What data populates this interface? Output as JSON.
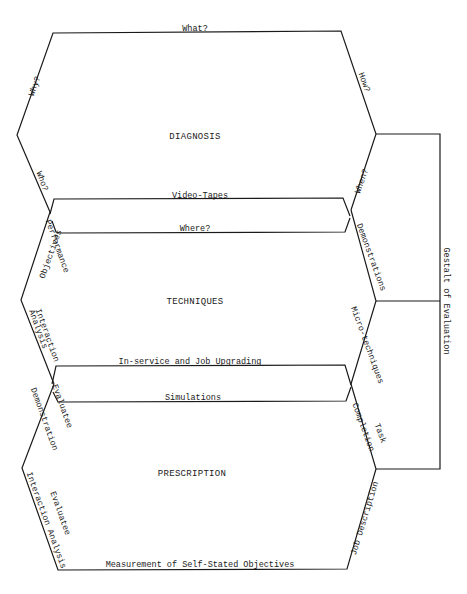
{
  "diagram": {
    "stages": [
      {
        "id": "diagnosis",
        "label": "DIAGNOSIS"
      },
      {
        "id": "techniques",
        "label": "TECHNIQUES"
      },
      {
        "id": "prescription",
        "label": "PRESCRIPTION"
      }
    ],
    "diagnosis_edges": {
      "top": "What?",
      "upper_left": "Why?",
      "upper_right": "How?",
      "lower_left": "Who?",
      "lower_right": "When?"
    },
    "band1": {
      "top": "Video-Tapes",
      "bottom": "Where?"
    },
    "techniques_edges": {
      "upper_left": [
        "Performance",
        "Objectives"
      ],
      "upper_right": "Demonstrations",
      "lower_left": [
        "Interaction",
        "Analysis"
      ],
      "lower_right": "Micro-techniques"
    },
    "band2": {
      "top": "In-service and Job Upgrading",
      "bottom": "Simulations"
    },
    "prescription_edges": {
      "upper_left": [
        "Evaluatee",
        "Demonstration"
      ],
      "upper_right": [
        "Task",
        "Completion"
      ],
      "lower_left": [
        "Evaluatee",
        "Interaction Analysis"
      ],
      "lower_right": "Job Description",
      "bottom": "Measurement of Self-Stated Objectives"
    },
    "bracket": {
      "label": "Gestalt of Evaluation"
    }
  }
}
